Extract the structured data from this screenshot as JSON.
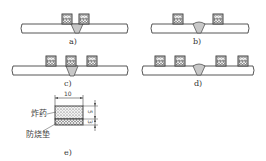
{
  "figure": {
    "panels": [
      {
        "id": "a",
        "label": "a)",
        "charges": 2,
        "arrangement": "adjacent to weld on both sides"
      },
      {
        "id": "b",
        "label": "b)",
        "charges": 2,
        "arrangement": "spaced away from weld on both sides"
      },
      {
        "id": "c",
        "label": "c)",
        "charges": 3,
        "arrangement": "one on weld, one on each side"
      },
      {
        "id": "d",
        "label": "d)",
        "charges": 4,
        "arrangement": "two on each side of weld"
      },
      {
        "id": "e",
        "label": "e)",
        "arrangement": "charge cross-section detail"
      }
    ],
    "detail_e": {
      "width_dim": "10",
      "explosive_height_dim": "5",
      "pad_height_dim": "3",
      "explosive_label": "炸药",
      "pad_label": "防烧垫"
    },
    "colors": {
      "line": "#444444",
      "weld_fill": "#c8c8c8",
      "charge_fill": "#e8e8e8"
    }
  }
}
